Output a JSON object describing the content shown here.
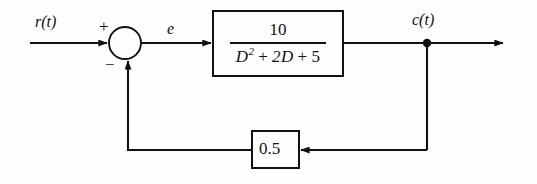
{
  "diagram": {
    "type": "closed-loop feedback control block diagram",
    "background_color": "#fdfdfd",
    "line_color": "#111111",
    "signals": {
      "input_label": "r(t)",
      "error_label": "e",
      "output_label": "c(t)"
    },
    "summing_junction": {
      "name": "summing-junction",
      "plus_sign": "+",
      "minus_sign": "−",
      "center_x": 125,
      "center_y": 43,
      "radius": 16
    },
    "forward_block": {
      "name": "forward-transfer-function",
      "numerator": "10",
      "denominator_var": "D",
      "denominator_exponent": "2",
      "denominator_plus_one": "+",
      "denominator_term_two": "2D",
      "denominator_plus_two": "+",
      "denominator_term_three": "5",
      "denominator_text": "D² + 2D + 5",
      "transfer_function_text": "10 / (D² + 2D + 5)",
      "x": 213,
      "y": 11,
      "width": 130,
      "height": 65
    },
    "feedback_block": {
      "name": "feedback-gain-block",
      "gain": "0.5",
      "x": 252,
      "y": 131,
      "width": 47,
      "height": 37
    },
    "takeoff_point": {
      "name": "output-takeoff-node",
      "x": 427,
      "y": 43
    },
    "wires": {
      "input_start_x": 30,
      "output_end_x": 505,
      "feedback_y": 150
    }
  }
}
